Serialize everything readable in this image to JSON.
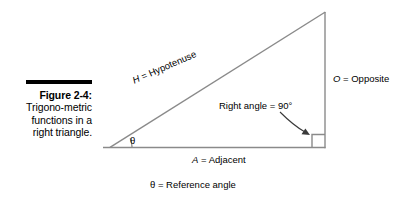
{
  "figure": {
    "caption": {
      "label": "Figure 2-4:",
      "body": "Trigono-metric functions in a right triangle."
    },
    "labels": {
      "hypotenuse": "H = Hypotenuse",
      "hypotenuse_symbol": "H",
      "hypotenuse_name": "Hypotenuse",
      "opposite_symbol": "O",
      "opposite_name": "Opposite",
      "adjacent_symbol": "A",
      "adjacent_name": "Adjacent",
      "right_angle": "Right angle = 90°",
      "theta_symbol": "θ",
      "reference_angle": "θ = Reference angle",
      "equals": " = "
    },
    "colors": {
      "stroke": "#8a8a8a",
      "text": "#000000",
      "rule": "#000000",
      "background": "#ffffff"
    },
    "geometry": {
      "left_vertex": [
        110,
        147
      ],
      "top_vertex": [
        325,
        12
      ],
      "right_vertex": [
        325,
        148
      ],
      "base_extends_left_to": 103,
      "right_angle_box_size": 13,
      "theta_arc_radius": 22
    }
  }
}
